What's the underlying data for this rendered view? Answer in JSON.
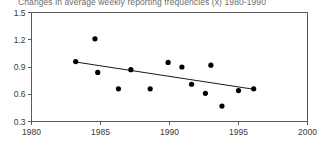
{
  "chart_data": {
    "type": "scatter",
    "title": "Changes in average weekly reporting frequencies (x) 1980-1990",
    "xlabel": "",
    "ylabel": "",
    "xlim": [
      1980,
      2000
    ],
    "ylim": [
      0.3,
      1.5
    ],
    "grid": false,
    "legend": "none",
    "x_ticks": [
      1980,
      1985,
      1990,
      1995,
      2000
    ],
    "x_tick_labels": [
      "1980",
      "1985",
      "1990",
      "1995",
      "2000"
    ],
    "y_ticks": [
      0.3,
      0.6,
      0.9,
      1.2,
      1.5
    ],
    "y_tick_labels": [
      "0.3",
      "0.6",
      "0.9",
      "1.2",
      "1.5"
    ],
    "series": [
      {
        "name": "reporting frequency",
        "type": "scatter",
        "points": [
          {
            "x": 1983.2,
            "y": 0.96
          },
          {
            "x": 1984.6,
            "y": 1.21
          },
          {
            "x": 1984.8,
            "y": 0.84
          },
          {
            "x": 1986.3,
            "y": 0.66
          },
          {
            "x": 1987.2,
            "y": 0.87
          },
          {
            "x": 1988.6,
            "y": 0.66
          },
          {
            "x": 1989.9,
            "y": 0.95
          },
          {
            "x": 1990.9,
            "y": 0.9
          },
          {
            "x": 1991.6,
            "y": 0.71
          },
          {
            "x": 1992.6,
            "y": 0.61
          },
          {
            "x": 1993.0,
            "y": 0.92
          },
          {
            "x": 1993.8,
            "y": 0.47
          },
          {
            "x": 1995.0,
            "y": 0.64
          },
          {
            "x": 1996.1,
            "y": 0.66
          }
        ]
      },
      {
        "name": "trend line",
        "type": "line",
        "points": [
          {
            "x": 1983.2,
            "y": 0.955
          },
          {
            "x": 1996.1,
            "y": 0.655
          }
        ]
      }
    ]
  }
}
